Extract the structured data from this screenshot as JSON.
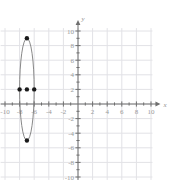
{
  "canvas": {
    "width": 170,
    "height": 183,
    "background": "#ffffff"
  },
  "graph": {
    "name": "coordinate-plane-with-ellipse",
    "grid_color": "#e2e2e6",
    "axis_color": "#6f6f6f",
    "curve_color": "#7a7a7a",
    "point_color": "#1a1a1a",
    "label_color": "#9a9a9a",
    "origin_px": {
      "x": 78,
      "y": 104
    },
    "pixels_per_unit": 7.3,
    "grid_step_units": 2,
    "xaxis_label": "x",
    "yaxis_label": "y",
    "x_tick_labels": [
      "-10",
      "-8",
      "-6",
      "-4",
      "-2",
      "2",
      "4",
      "6",
      "8",
      "10"
    ],
    "x_tick_values": [
      -10,
      -8,
      -6,
      -4,
      -2,
      2,
      4,
      6,
      8,
      10
    ],
    "y_tick_labels": [
      "10",
      "8",
      "6",
      "4",
      "2",
      "-2",
      "-4",
      "-6",
      "-8",
      "-10"
    ],
    "y_tick_values": [
      10,
      8,
      6,
      4,
      2,
      -2,
      -4,
      -6,
      -8,
      -10
    ]
  },
  "chart_data": {
    "type": "scatter",
    "title": "",
    "xlabel": "x",
    "ylabel": "y",
    "xlim": [
      -11,
      11
    ],
    "ylim": [
      -11,
      11
    ],
    "grid": true,
    "legend": "none",
    "series": [
      {
        "name": "ellipse",
        "type": "ellipse",
        "center": [
          -7,
          2
        ],
        "semi_axis_x": 1,
        "semi_axis_y": 7,
        "vertices": [
          [
            -7,
            9
          ],
          [
            -7,
            -5
          ]
        ],
        "co_vertices": [
          [
            -8,
            2
          ],
          [
            -6,
            2
          ]
        ],
        "color": "#7a7a7a"
      },
      {
        "name": "marked-points",
        "type": "scatter",
        "points": [
          {
            "x": -7,
            "y": 9,
            "label": "top-vertex"
          },
          {
            "x": -7,
            "y": -5,
            "label": "bottom-vertex"
          },
          {
            "x": -8,
            "y": 2,
            "label": "left-co-vertex"
          },
          {
            "x": -7,
            "y": 2,
            "label": "center"
          },
          {
            "x": -6,
            "y": 2,
            "label": "right-co-vertex"
          }
        ],
        "color": "#1a1a1a"
      }
    ]
  }
}
